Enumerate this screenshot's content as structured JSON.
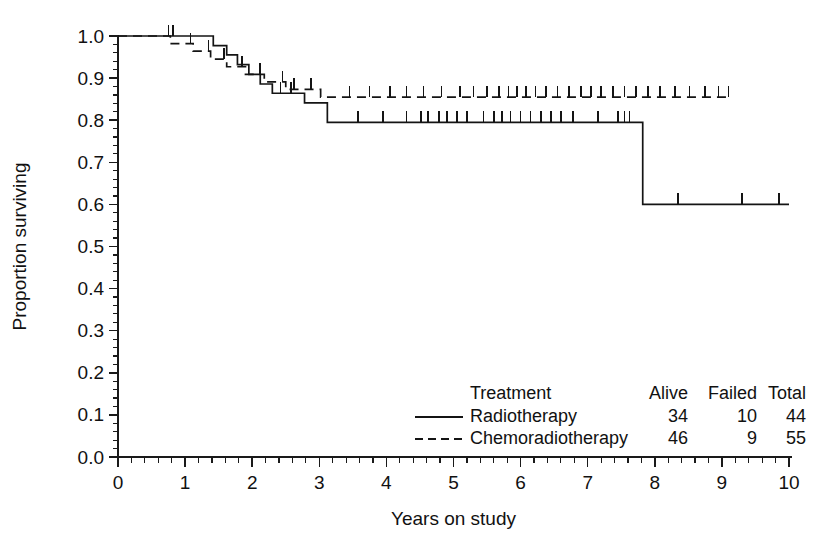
{
  "chart_data": {
    "type": "line",
    "subtype": "kaplan-meier-survival",
    "title": "",
    "xlabel": "Years on study",
    "ylabel": "Proportion surviving",
    "xlim": [
      0,
      10
    ],
    "ylim": [
      0.0,
      1.0
    ],
    "grid": false,
    "xticks": [
      0,
      1,
      2,
      3,
      4,
      5,
      6,
      7,
      8,
      9,
      10
    ],
    "xtick_labels": [
      "0",
      "1",
      "2",
      "3",
      "4",
      "5",
      "6",
      "7",
      "8",
      "9",
      "10"
    ],
    "x_minor_tick_interval": 0.2,
    "yticks": [
      0.0,
      0.1,
      0.2,
      0.3,
      0.4,
      0.5,
      0.6,
      0.7,
      0.8,
      0.9,
      1.0
    ],
    "ytick_labels": [
      "0.0",
      "0.1",
      "0.2",
      "0.3",
      "0.4",
      "0.5",
      "0.6",
      "0.7",
      "0.8",
      "0.9",
      "1.0"
    ],
    "y_minor_tick_interval": 0.02,
    "legend_position": "bottom-right",
    "line_color": "#141414",
    "series": [
      {
        "name": "Radiotherapy",
        "style": "solid",
        "steps": [
          [
            0.0,
            1.0
          ],
          [
            1.27,
            1.0
          ],
          [
            1.42,
            0.977
          ],
          [
            1.62,
            0.955
          ],
          [
            1.78,
            0.932
          ],
          [
            1.95,
            0.909
          ],
          [
            2.12,
            0.886
          ],
          [
            2.3,
            0.864
          ],
          [
            2.72,
            0.864
          ],
          [
            2.78,
            0.841
          ],
          [
            3.05,
            0.841
          ],
          [
            3.12,
            0.795
          ],
          [
            7.78,
            0.795
          ],
          [
            7.82,
            0.6
          ],
          [
            10.0,
            0.6
          ]
        ],
        "censor_times": [
          0.82,
          2.42,
          2.58,
          3.58,
          3.95,
          4.3,
          4.52,
          4.62,
          4.78,
          4.9,
          5.05,
          5.2,
          5.45,
          5.6,
          5.72,
          5.85,
          6.0,
          6.15,
          6.3,
          6.45,
          6.6,
          6.78,
          7.15,
          7.45,
          7.55,
          7.62,
          8.35,
          9.3,
          9.85
        ],
        "censor_level_note": "marks sit on the current step level"
      },
      {
        "name": "Chemoradiotherapy",
        "style": "dashed",
        "steps": [
          [
            0.0,
            1.0
          ],
          [
            0.72,
            1.0
          ],
          [
            0.78,
            0.982
          ],
          [
            1.05,
            0.982
          ],
          [
            1.12,
            0.964
          ],
          [
            1.3,
            0.964
          ],
          [
            1.38,
            0.945
          ],
          [
            1.55,
            0.945
          ],
          [
            1.62,
            0.927
          ],
          [
            1.82,
            0.927
          ],
          [
            1.9,
            0.909
          ],
          [
            2.08,
            0.909
          ],
          [
            2.18,
            0.891
          ],
          [
            2.42,
            0.891
          ],
          [
            2.5,
            0.873
          ],
          [
            2.95,
            0.873
          ],
          [
            3.02,
            0.855
          ],
          [
            9.12,
            0.855
          ]
        ],
        "censor_times": [
          0.75,
          1.08,
          1.35,
          1.58,
          1.85,
          2.12,
          2.45,
          2.62,
          2.88,
          3.45,
          3.75,
          4.05,
          4.3,
          4.55,
          4.82,
          5.1,
          5.3,
          5.5,
          5.68,
          5.82,
          5.95,
          6.08,
          6.22,
          6.38,
          6.55,
          6.72,
          6.9,
          7.05,
          7.2,
          7.38,
          7.55,
          7.72,
          7.9,
          8.08,
          8.3,
          8.52,
          8.75,
          8.95,
          9.1
        ]
      }
    ],
    "summary_table": {
      "row_header": "Treatment",
      "columns": [
        "Alive",
        "Failed",
        "Total"
      ],
      "rows": [
        {
          "treatment": "Radiotherapy",
          "style": "solid",
          "alive": "34",
          "failed": "10",
          "total": "44"
        },
        {
          "treatment": "Chemoradiotherapy",
          "style": "dashed",
          "alive": "46",
          "failed": "9",
          "total": "55"
        }
      ]
    }
  }
}
